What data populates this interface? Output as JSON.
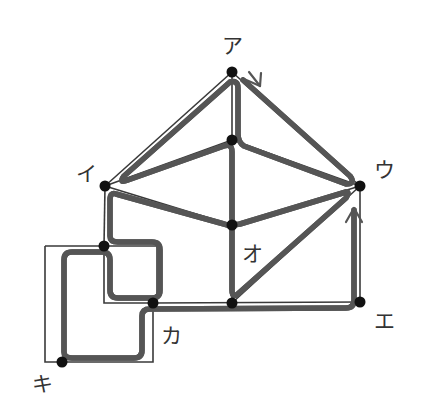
{
  "diagram": {
    "colors": {
      "edge": "#3a3a3a",
      "route_outer": "#555555",
      "route_inner": "#ffffff",
      "node": "#111111",
      "label": "#333333"
    },
    "labels": {
      "a": "ア",
      "i": "イ",
      "u": "ウ",
      "e": "エ",
      "o": "オ",
      "ka": "カ",
      "ki": "キ"
    },
    "nodes": [
      {
        "id": "a",
        "label": "ア",
        "x": 232,
        "y": 72
      },
      {
        "id": "top_center",
        "label": "",
        "x": 232,
        "y": 140
      },
      {
        "id": "i",
        "label": "イ",
        "x": 105,
        "y": 186
      },
      {
        "id": "u",
        "label": "ウ",
        "x": 360,
        "y": 186
      },
      {
        "id": "o",
        "label": "オ",
        "x": 232,
        "y": 225
      },
      {
        "id": "left_mid",
        "label": "",
        "x": 104,
        "y": 246
      },
      {
        "id": "ka",
        "label": "カ",
        "x": 153,
        "y": 303
      },
      {
        "id": "bottom_mid",
        "label": "",
        "x": 232,
        "y": 303
      },
      {
        "id": "e",
        "label": "エ",
        "x": 360,
        "y": 302
      },
      {
        "id": "ki",
        "label": "キ",
        "x": 62,
        "y": 362
      }
    ],
    "edges": [
      [
        "a",
        "i"
      ],
      [
        "a",
        "u"
      ],
      [
        "a",
        "top_center"
      ],
      [
        "top_center",
        "i"
      ],
      [
        "top_center",
        "u"
      ],
      [
        "top_center",
        "o"
      ],
      [
        "i",
        "o"
      ],
      [
        "o",
        "u"
      ],
      [
        "i",
        "left_mid"
      ],
      [
        "o",
        "bottom_mid"
      ],
      [
        "bottom_mid",
        "u"
      ],
      [
        "u",
        "e"
      ],
      [
        "ka",
        "bottom_mid"
      ],
      [
        "bottom_mid",
        "e"
      ],
      [
        "left_mid",
        "ka"
      ],
      [
        "ka",
        "ki"
      ],
      [
        "left_mid",
        "ki"
      ]
    ],
    "arrows": [
      {
        "near": "a",
        "direction": "toward ウ along ア-ウ edge"
      },
      {
        "near": "u",
        "direction": "upward toward ウ from エ"
      }
    ]
  }
}
